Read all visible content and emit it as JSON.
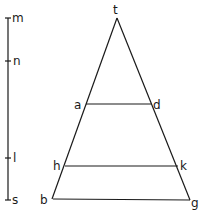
{
  "diagram": {
    "scale": {
      "labels": {
        "m": "m",
        "n": "n",
        "l": "l",
        "s": "s"
      }
    },
    "triangle": {
      "labels": {
        "t": "t",
        "a": "a",
        "d": "d",
        "h": "h",
        "k": "k",
        "b": "b",
        "g": "g"
      }
    },
    "colors": {
      "line": "#1a1a1a",
      "background": "#ffffff"
    }
  }
}
